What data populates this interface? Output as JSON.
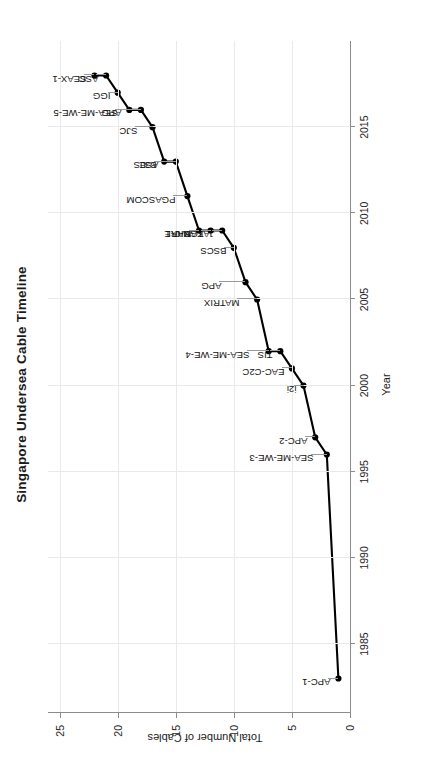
{
  "chart_data": {
    "type": "line",
    "title": "Singapore Undersea Cable Timeline",
    "xlabel": "Year",
    "ylabel": "Total Number of Cables",
    "xlim": [
      1981,
      2020
    ],
    "ylim": [
      0,
      26
    ],
    "grid": true,
    "legend": "none",
    "marker": "filled-circle",
    "line_color": "#000000",
    "grid_color": "#e9e9e9",
    "axis_color": "#8c8c8c",
    "xticks": [
      1985,
      1990,
      1995,
      2000,
      2005,
      2010,
      2015
    ],
    "xtick_labels": [
      "1985",
      "1990",
      "1995",
      "2000",
      "2005",
      "2010",
      "2015"
    ],
    "yticks": [
      0,
      5,
      10,
      15,
      20,
      25
    ],
    "ytick_labels": [
      "0",
      "5",
      "10",
      "15",
      "20",
      "25"
    ],
    "x": [
      1983,
      1996,
      1997,
      2000,
      2001,
      2002,
      2002,
      2005,
      2006,
      2008,
      2009,
      2009,
      2009,
      2011,
      2013,
      2013,
      2015,
      2016,
      2016,
      2017,
      2018,
      2018
    ],
    "y": [
      1,
      2,
      3,
      4,
      5,
      6,
      7,
      8,
      9,
      10,
      11,
      12,
      13,
      14,
      15,
      16,
      17,
      18,
      19,
      20,
      21,
      22
    ],
    "point_labels": [
      "APC-1",
      "SEA-ME-WE-3",
      "APC-2",
      "i2i",
      "EAC-C2C",
      "TIS",
      "SEA-ME-WE-4",
      "MATRIX",
      "APG",
      "BSCS",
      "JAKABARE",
      "TGN-IA",
      "MIC-1",
      "PGASCOM",
      "ASE",
      "B3JS",
      "SJC",
      "SEA-ME-WE-5",
      "APG",
      "IGG",
      "ASC",
      "SEAX-1"
    ],
    "series": [
      {
        "name": "Cumulative cables",
        "points": [
          {
            "label": "APC-1",
            "year": 1983,
            "count": 1
          },
          {
            "label": "SEA-ME-WE-3",
            "year": 1996,
            "count": 2
          },
          {
            "label": "APC-2",
            "year": 1997,
            "count": 3
          },
          {
            "label": "i2i",
            "year": 2000,
            "count": 4
          },
          {
            "label": "EAC-C2C",
            "year": 2001,
            "count": 5
          },
          {
            "label": "TIS",
            "year": 2002,
            "count": 6
          },
          {
            "label": "SEA-ME-WE-4",
            "year": 2002,
            "count": 7
          },
          {
            "label": "MATRIX",
            "year": 2005,
            "count": 8
          },
          {
            "label": "APG",
            "year": 2006,
            "count": 9
          },
          {
            "label": "BSCS",
            "year": 2008,
            "count": 10
          },
          {
            "label": "JAKABARE",
            "year": 2009,
            "count": 11
          },
          {
            "label": "TGN-IA",
            "year": 2009,
            "count": 12
          },
          {
            "label": "MIC-1",
            "year": 2009,
            "count": 13
          },
          {
            "label": "PGASCOM",
            "year": 2011,
            "count": 14
          },
          {
            "label": "ASE",
            "year": 2013,
            "count": 15
          },
          {
            "label": "B3JS",
            "year": 2013,
            "count": 16
          },
          {
            "label": "SJC",
            "year": 2015,
            "count": 17
          },
          {
            "label": "SEA-ME-WE-5",
            "year": 2016,
            "count": 18
          },
          {
            "label": "APG",
            "year": 2016,
            "count": 19
          },
          {
            "label": "IGG",
            "year": 2017,
            "count": 20
          },
          {
            "label": "ASC",
            "year": 2018,
            "count": 21
          },
          {
            "label": "SEAX-1",
            "year": 2018,
            "count": 22
          }
        ]
      }
    ]
  }
}
